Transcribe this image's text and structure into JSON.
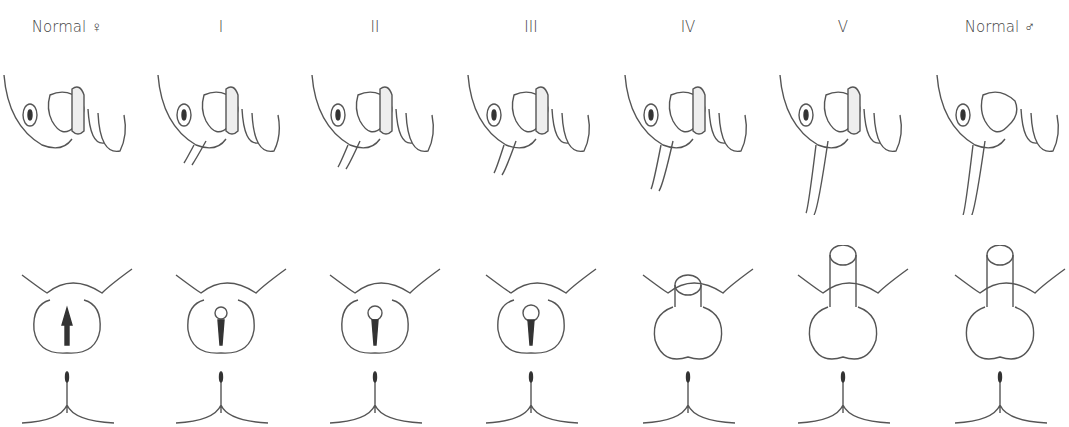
{
  "columns": [
    {
      "label": "Normal ♀",
      "stage": "female"
    },
    {
      "label": "I",
      "stage": 1
    },
    {
      "label": "II",
      "stage": 2
    },
    {
      "label": "III",
      "stage": 3
    },
    {
      "label": "IV",
      "stage": 4
    },
    {
      "label": "V",
      "stage": 5
    },
    {
      "label": "Normal ♂",
      "stage": "male"
    }
  ],
  "rows": [
    "sagittal-section",
    "external-view"
  ]
}
